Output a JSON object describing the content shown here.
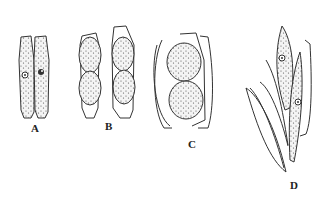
{
  "figure": {
    "type": "scientific-illustration",
    "panels": [
      {
        "label": "A",
        "content": "two adjacent elongate cells each with a central nucleus"
      },
      {
        "label": "B",
        "content": "two frustules each containing two stippled rounded bodies"
      },
      {
        "label": "C",
        "content": "open frustule valves containing two large stippled spherical bodies"
      },
      {
        "label": "D",
        "content": "two fusiform cells with nuclei alongside empty valves"
      }
    ]
  },
  "colors": {
    "ink": "#333333",
    "background": "#ffffff"
  }
}
